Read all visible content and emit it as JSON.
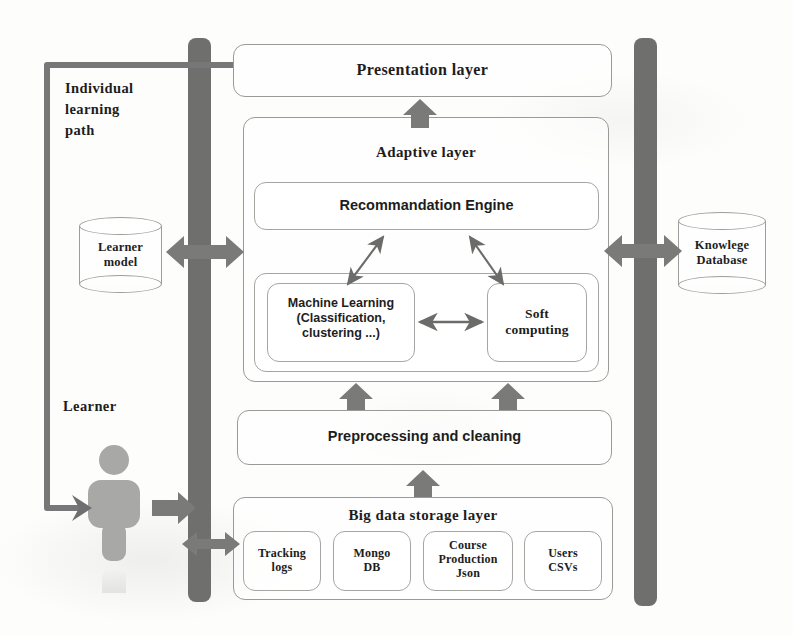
{
  "diagram": {
    "colors": {
      "bar_gray": "#6f6f6d",
      "arrow_gray": "#7a7a78",
      "thin_arrow_gray": "#6b6b69",
      "box_border": "#9a9a96",
      "person_gray": "#a8a8a6",
      "text": "#1d1d1d",
      "background": "#fdfdfc"
    },
    "layers": {
      "presentation": "Presentation layer",
      "adaptive": "Adaptive layer",
      "recommendation_engine": "Recommandation Engine",
      "machine_learning": "Machine Learning\n(Classification,\nclustering ...)",
      "soft_computing": "Soft\ncomputing",
      "preprocessing": "Preprocessing and cleaning",
      "big_data_storage": "Big data storage layer"
    },
    "storage_sources": [
      {
        "label": "Tracking\nlogs"
      },
      {
        "label": "Mongo\nDB"
      },
      {
        "label": "Course\nProduction\nJson"
      },
      {
        "label": "Users\nCSVs"
      }
    ],
    "databases": {
      "learner_model": "Learner\nmodel",
      "knowledge_database": "Knowlege\nDatabase"
    },
    "annotations": {
      "individual_learning_path": "Individual\nlearning\npath",
      "learner": "Learner"
    },
    "connectors": {
      "presentation_feedback_path": "individual-learning-path-loop",
      "learner_to_bus": "learner-input-arrow",
      "bus_to_storage": "bus-to-storage-bidirectional",
      "learner_model_bus": "learner-model-bidirectional",
      "knowledge_db_bus": "knowledge-database-bidirectional",
      "ml_soft_link": "ml-softcomputing-bidirectional",
      "engine_feeds": "engine-bidirectional-diagonals"
    }
  }
}
